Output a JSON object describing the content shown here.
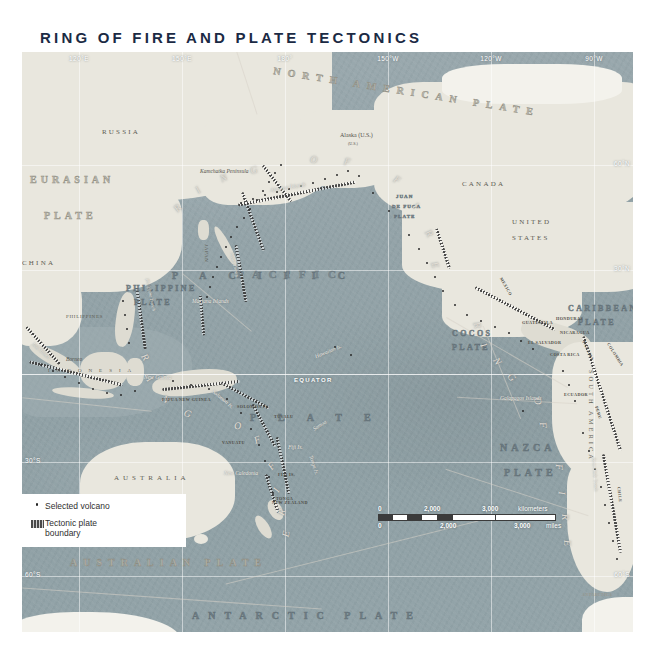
{
  "title": "RING OF FIRE AND PLATE TECTONICS",
  "colors": {
    "title": "#1b2a44",
    "ocean": "#93a3a8",
    "land": "#e9e7de",
    "volcano_dot": "#2b2b2b",
    "graticule": "#ffffff"
  },
  "graticule": {
    "longitudes": [
      "120°E",
      "150°E",
      "180°",
      "150°W",
      "120°W",
      "90°W"
    ],
    "latitudes_left": [
      "30°S",
      "60°S"
    ],
    "latitudes_right": [
      "60°N",
      "30°N",
      "60°S"
    ],
    "equator_label": "EQUATOR"
  },
  "plates": [
    {
      "name": "EURASIAN PLATE",
      "line1": "EURASIAN",
      "line2": "PLATE"
    },
    {
      "name": "NORTH AMERICAN PLATE",
      "text": "NORTH AMERICAN PLATE"
    },
    {
      "name": "PACIFIC PLATE",
      "line1": "PACIFIC",
      "line2": "PLATE"
    },
    {
      "name": "PHILIPPINE PLATE",
      "line1": "PHILIPPINE",
      "line2": "PLATE"
    },
    {
      "name": "AUSTRALIAN PLATE",
      "text": "AUSTRALIAN PLATE"
    },
    {
      "name": "ANTARCTIC PLATE",
      "text": "ANTARCTIC PLATE"
    },
    {
      "name": "NAZCA PLATE",
      "line1": "NAZCA",
      "line2": "PLATE"
    },
    {
      "name": "COCOS PLATE",
      "line1": "COCOS",
      "line2": "PLATE"
    },
    {
      "name": "CARIBBEAN PLATE",
      "line1": "CARIBBEAN",
      "line2": "PLATE"
    },
    {
      "name": "JUAN DE FUCA PLATE",
      "line1": "JUAN",
      "line2": "DE FUCA",
      "line3": "PLATE"
    }
  ],
  "ring_of_fire_letters": [
    "R",
    "I",
    "N",
    "G",
    "O",
    "F",
    "F",
    "I",
    "R",
    "E"
  ],
  "ocean_label": "PACIFIC",
  "continents": [
    {
      "label": "RUSSIA"
    },
    {
      "label": "CHINA"
    },
    {
      "label": "CANADA"
    },
    {
      "label": "UNITED STATES",
      "line1": "UNITED",
      "line2": "STATES"
    },
    {
      "label": "AUSTRALIA"
    },
    {
      "label": "SOUTH AMERICA"
    },
    {
      "label": "ANTARCTICA"
    }
  ],
  "countries": [
    "JAPAN",
    "PHILIPPINES",
    "INDONESIA",
    "PAPUA NEW GUINEA",
    "NEW ZEALAND",
    "MEXICO",
    "GUATEMALA",
    "EL SALVADOR",
    "HONDURAS",
    "NICARAGUA",
    "COSTA RICA",
    "PANAMA",
    "COLOMBIA",
    "ECUADOR",
    "PERU",
    "CHILE",
    "TUVALU",
    "VANUATU",
    "SOLOMON IS.",
    "FIJI IS.",
    "TONGA"
  ],
  "features": [
    "Kamchatka Peninsula",
    "Aleutian Islands",
    "Alaska (U.S.)",
    "Mariana Islands",
    "Hawaiian Is.",
    "Borneo",
    "New Guinea",
    "New Caledonia",
    "Galapagos Islands",
    "Solomon Is.",
    "Fiji Is.",
    "Tonga Is.",
    "Samoa",
    "Philippine Trench",
    "Japan Trench",
    "Peru-Chile Trench",
    "Java Trench"
  ],
  "alaska_sub": "(U.S.)",
  "legend": {
    "items": [
      {
        "key": "dot",
        "label": "Selected volcano",
        "line1": "Selected volcano",
        "line2": ""
      },
      {
        "key": "band",
        "label": "Tectonic plate boundary",
        "line1": "Tectonic plate",
        "line2": "boundary"
      }
    ]
  },
  "scale": {
    "km_zero": "0",
    "km_mid": "2,000",
    "km_end": "3,000",
    "km_unit": "kilometers",
    "mi_zero": "0",
    "mi_mid": "2,000",
    "mi_end": "3,000",
    "mi_unit": "miles"
  }
}
